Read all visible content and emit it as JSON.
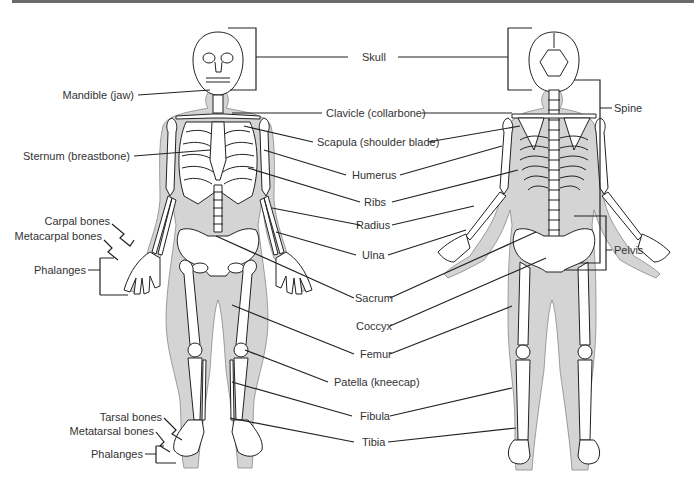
{
  "diagram": {
    "colors": {
      "header_bar": "#6a6a6a",
      "body_fill": "#d4d4d4",
      "bone_fill": "#ffffff",
      "outline": "#222222",
      "label_text": "#333333"
    },
    "views": [
      "front",
      "back"
    ],
    "labels": {
      "left": {
        "mandible": "Mandible (jaw)",
        "sternum": "Sternum (breastbone)",
        "carpal": "Carpal bones",
        "metacarpal": "Metacarpal bones",
        "phalanges_hand": "Phalanges",
        "tarsal": "Tarsal bones",
        "metatarsal": "Metatarsal bones",
        "phalanges_foot": "Phalanges"
      },
      "center": {
        "skull": "Skull",
        "clavicle": "Clavicle (collarbone)",
        "scapula": "Scapula (shoulder blade)",
        "humerus": "Humerus",
        "ribs": "Ribs",
        "radius": "Radius",
        "ulna": "Ulna",
        "sacrum": "Sacrum",
        "coccyx": "Coccyx",
        "femur": "Femur",
        "patella": "Patella (kneecap)",
        "fibula": "Fibula",
        "tibia": "Tibia"
      },
      "right": {
        "spine": "Spine",
        "pelvis": "Pelvis"
      }
    }
  }
}
